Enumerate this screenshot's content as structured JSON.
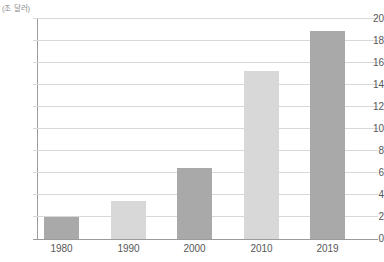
{
  "chart_data": {
    "type": "bar",
    "categories": [
      "1980",
      "1990",
      "2000",
      "2010",
      "2019"
    ],
    "values": [
      2.0,
      3.5,
      6.5,
      15.3,
      18.9
    ],
    "title": "",
    "xlabel": "",
    "ylabel": "(조 달러)",
    "ylim": [
      0,
      20
    ],
    "ytick_step": 2,
    "yticks": [
      0,
      2,
      4,
      6,
      8,
      10,
      12,
      14,
      16,
      18,
      20
    ],
    "grid": true,
    "legend": "none",
    "bar_colors": [
      "#a9a9a9",
      "#d8d8d8",
      "#a9a9a9",
      "#d8d8d8",
      "#a9a9a9"
    ]
  },
  "colors": {
    "bar_dark": "#a9a9a9",
    "bar_light": "#d8d8d8",
    "gridline": "#d8d8d8",
    "axis": "#9b9b9b",
    "tick_label": "#575757",
    "unit_label": "#8a8a8a",
    "background": "#ffffff"
  }
}
